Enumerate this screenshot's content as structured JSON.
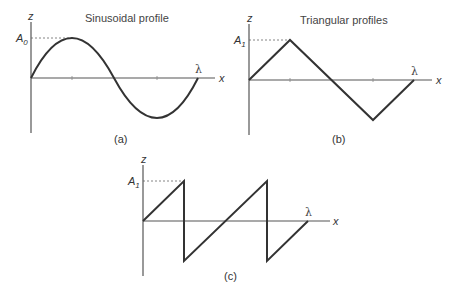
{
  "panels": {
    "a": {
      "title": "Sinusoidal profile",
      "z_label": "z",
      "x_label": "x",
      "amp_label": "A",
      "amp_sub": "0",
      "lambda_label": "λ",
      "caption": "(a)",
      "profile": "sinusoid"
    },
    "b": {
      "title": "Triangular profiles",
      "z_label": "z",
      "x_label": "x",
      "amp_label": "A",
      "amp_sub": "1",
      "lambda_label": "λ",
      "caption": "(b)",
      "profile": "triangle"
    },
    "c": {
      "z_label": "z",
      "x_label": "x",
      "amp_label": "A",
      "amp_sub": "1",
      "lambda_label": "λ",
      "caption": "(c)",
      "profile": "sawtooth"
    }
  },
  "colors": {
    "curve": "#333333",
    "axis": "#555555",
    "text": "#444444"
  }
}
